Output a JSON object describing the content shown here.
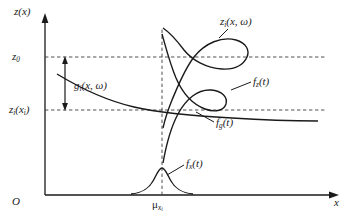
{
  "figure": {
    "axes": {
      "y_label": "z(x)",
      "x_label": "x",
      "origin_label": "O"
    },
    "y_ticks": [
      {
        "id": "z0",
        "label_main": "z",
        "label_sub": "0",
        "value": 57
      },
      {
        "id": "zxi",
        "label_main": "z",
        "label_sub": "i",
        "label_tail": "(x",
        "label_tail_sub": "i",
        "label_tail_end": ")",
        "value": 110
      }
    ],
    "x_ticks": [
      {
        "id": "mu",
        "label_main": "μ",
        "label_sub": "x",
        "label_subsub": "i",
        "value": 162
      }
    ],
    "annotations": {
      "gap_arrow": {
        "label_main": "g",
        "label_sub": "i",
        "label_tail": "(x, ω)"
      },
      "response_curve": {
        "label_main": "z",
        "label_sub": "i",
        "label_tail": "(x, ω)"
      },
      "pdf_z": {
        "label_main": "f",
        "label_sub": "z",
        "label_tail": "(t)"
      },
      "pdf_g": {
        "label_main": "f",
        "label_sub": "g",
        "label_tail": "(t)"
      },
      "pdf_x": {
        "label_main": "f",
        "label_sub": "x",
        "label_tail": "(t)"
      }
    },
    "colors": {
      "stroke": "#1a1a1a",
      "dashed": "#4a4a4a",
      "background": "#ffffff"
    }
  }
}
